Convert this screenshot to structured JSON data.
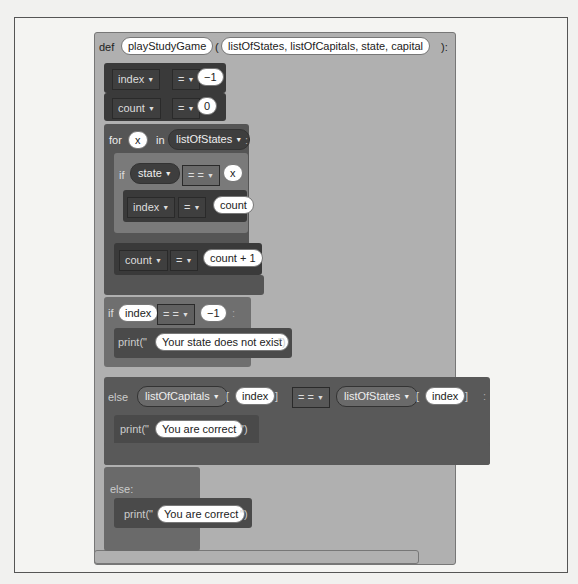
{
  "function_def": {
    "keyword": "def",
    "name": "playStudyGame",
    "open_paren": "(",
    "params": "listOfStates, listOfCapitals, state, capital",
    "close": "):"
  },
  "stmts": {
    "assign_index": {
      "var": "index",
      "op": "=",
      "value": "−1"
    },
    "assign_count": {
      "var": "count",
      "op": "=",
      "value": "0"
    },
    "for_loop": {
      "keyword": "for",
      "var": "x",
      "in_kw": "in",
      "iterable": "listOfStates",
      "colon": ":",
      "if_block": {
        "keyword": "if",
        "left": "state",
        "op": "= =",
        "right": "x",
        "colon": ":",
        "body": {
          "var": "index",
          "op": "=",
          "value": "count"
        }
      },
      "increment": {
        "var": "count",
        "op": "=",
        "value": "count + 1"
      }
    },
    "if_not_found": {
      "keyword": "if",
      "left": "index",
      "op": "= =",
      "right": "−1",
      "colon": ":",
      "print_prefix": "print(\"",
      "print_text": "Your state does not exist",
      "print_suffix": "\")"
    },
    "elif_block": {
      "keyword": "else",
      "left_list": "listOfCapitals",
      "left_index": "index",
      "op": "= =",
      "right_list": "listOfStates",
      "right_index": "index",
      "lbracket": "[",
      "rbracket": "]",
      "colon": ":",
      "print_prefix": "print(\"",
      "print_text": "You are correct",
      "print_suffix": "\")"
    },
    "else_block": {
      "keyword": "else:",
      "print_prefix": "print(\"",
      "print_text": "You are correct",
      "print_suffix": "\")"
    }
  },
  "colors": {
    "def_block": "#a9a9a9",
    "assign_block": "#3d3d3d",
    "for_block": "#575757",
    "if_block": "#7b7b7b",
    "if_main": "#6f6f6f",
    "print_block": "#4b4b4b",
    "elif_block": "#595959"
  }
}
